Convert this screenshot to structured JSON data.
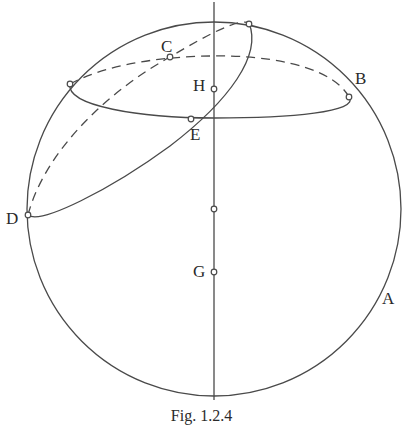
{
  "figure": {
    "caption": "Fig. 1.2.4",
    "labels": {
      "A": "A",
      "B": "B",
      "C": "C",
      "D": "D",
      "E": "E",
      "G": "G",
      "H": "H"
    },
    "colors": {
      "stroke": "#4a4a4a",
      "background": "#ffffff"
    },
    "elements": [
      "sphere outline (circle)",
      "vertical axis line",
      "horizontal small circle (ellipse, back half dashed) through B",
      "tilted great circle (ellipse, back half dashed) through D, C, H, E",
      "points on axis: H, center, G"
    ]
  }
}
